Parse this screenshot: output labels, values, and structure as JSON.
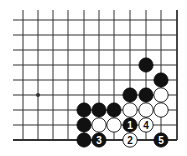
{
  "diagram": {
    "type": "go-board-fragment",
    "corner": "bottom-right",
    "grid": {
      "x_lines": [
        23,
        38,
        53,
        68,
        84,
        99,
        114,
        130,
        146,
        161,
        177
      ],
      "y_lines": [
        20,
        35,
        50,
        65,
        80,
        95,
        110,
        125,
        140
      ],
      "left_extent": 13,
      "top_extent": 10,
      "edge_right_index": 10,
      "edge_bottom_index": 8
    },
    "star_points": [
      {
        "col": 1,
        "row": 5
      }
    ],
    "stones": [
      {
        "col": 8,
        "row": 3,
        "color": "black"
      },
      {
        "col": 9,
        "row": 4,
        "color": "black"
      },
      {
        "col": 7,
        "row": 5,
        "color": "black"
      },
      {
        "col": 8,
        "row": 5,
        "color": "black"
      },
      {
        "col": 9,
        "row": 5,
        "color": "white"
      },
      {
        "col": 4,
        "row": 6,
        "color": "black"
      },
      {
        "col": 5,
        "row": 6,
        "color": "black"
      },
      {
        "col": 6,
        "row": 6,
        "color": "black"
      },
      {
        "col": 7,
        "row": 6,
        "color": "white"
      },
      {
        "col": 8,
        "row": 6,
        "color": "white"
      },
      {
        "col": 9,
        "row": 6,
        "color": "white"
      },
      {
        "col": 4,
        "row": 7,
        "color": "black"
      },
      {
        "col": 5,
        "row": 7,
        "color": "white"
      },
      {
        "col": 6,
        "row": 7,
        "color": "white"
      },
      {
        "col": 7,
        "row": 7,
        "color": "black",
        "label": "1"
      },
      {
        "col": 8,
        "row": 7,
        "color": "white",
        "label": "4"
      },
      {
        "col": 4,
        "row": 8,
        "color": "black"
      },
      {
        "col": 5,
        "row": 8,
        "color": "black",
        "label": "3"
      },
      {
        "col": 7,
        "row": 8,
        "color": "white",
        "label": "2"
      },
      {
        "col": 9,
        "row": 8,
        "color": "black",
        "label": "5"
      }
    ],
    "move_labels": [
      "1",
      "2",
      "3",
      "4",
      "5"
    ],
    "colors": {
      "line": "#333333",
      "black_stone": "#111111",
      "white_stone": "#ffffff",
      "background": "#ffffff"
    }
  }
}
